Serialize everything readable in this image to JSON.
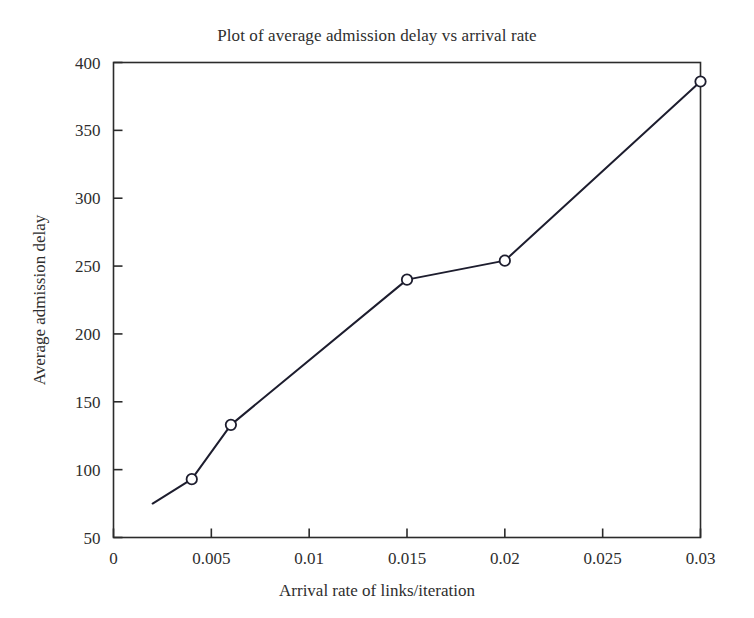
{
  "chart_data": {
    "type": "line",
    "title": "Plot of average admission delay vs arrival rate",
    "xlabel": "Arrival rate of links/iteration",
    "ylabel": "Average admission delay",
    "x": [
      0.002,
      0.004,
      0.006,
      0.015,
      0.02,
      0.03
    ],
    "values": [
      75,
      93,
      133,
      240,
      254,
      386
    ],
    "series": [
      {
        "name": "Average admission delay",
        "x": [
          0.002,
          0.004,
          0.006,
          0.015,
          0.02,
          0.03
        ],
        "values": [
          75,
          93,
          133,
          240,
          254,
          386
        ],
        "marker": "open-circle",
        "marker_shown": [
          false,
          true,
          true,
          true,
          true,
          true
        ],
        "line_color": "#1d1d2e",
        "marker_face_color": "#ffffff",
        "marker_edge_color": "#1d1d2e"
      }
    ],
    "xlim": [
      0,
      0.03
    ],
    "ylim": [
      50,
      400
    ],
    "xticks": [
      0,
      0.005,
      0.01,
      0.015,
      0.02,
      0.025,
      0.03
    ],
    "xtick_labels": [
      "0",
      "0.005",
      "0.01",
      "0.015",
      "0.02",
      "0.025",
      "0.03"
    ],
    "yticks": [
      50,
      100,
      150,
      200,
      250,
      300,
      350,
      400
    ],
    "ytick_labels": [
      "50",
      "100",
      "150",
      "200",
      "250",
      "300",
      "350",
      "400"
    ],
    "grid": false,
    "legend": null,
    "legend_position": "none",
    "frame": "box",
    "background_color": "#ffffff",
    "axis_color": "#2b2b2b",
    "annotations": []
  },
  "figure": {
    "title": "Plot of average admission delay vs arrival rate",
    "xlabel": "Arrival rate of links/iteration",
    "ylabel": "Average admission delay"
  }
}
